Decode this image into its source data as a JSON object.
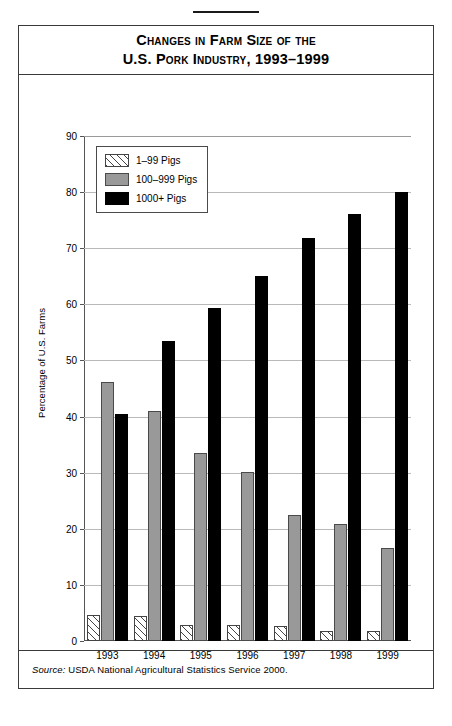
{
  "figure": {
    "title_line1": "Changes in Farm Size of the",
    "title_line2": "U.S. Pork Industry, 1993–1999",
    "source_label": "Source:",
    "source_text": " USDA National Agricultural Statistics Service 2000."
  },
  "colors": {
    "series_1_99": "#ffffff",
    "series_100_999": "#999999",
    "series_1000plus": "#000000",
    "gridline": "#b9b9b9",
    "axis": "#555555",
    "frame": "#3a3a3a"
  },
  "chart_data": {
    "type": "bar",
    "title": "Changes in Farm Size of the U.S. Pork Industry, 1993–1999",
    "xlabel": "",
    "ylabel": "Percentage of U.S. Farms",
    "categories": [
      "1993",
      "1994",
      "1995",
      "1996",
      "1997",
      "1998",
      "1999"
    ],
    "yticks": [
      0,
      10,
      20,
      30,
      40,
      50,
      60,
      70,
      80,
      90
    ],
    "ylim": [
      0,
      90
    ],
    "grid": true,
    "legend_position": "top-left inside",
    "series": [
      {
        "name": "1–99 Pigs",
        "values": [
          4.7,
          4.5,
          2.8,
          2.8,
          2.7,
          1.7,
          1.8
        ]
      },
      {
        "name": "100–999 Pigs",
        "values": [
          46.2,
          41.0,
          33.5,
          30.1,
          22.4,
          20.9,
          16.6
        ]
      },
      {
        "name": "1000+ Pigs",
        "values": [
          40.4,
          53.5,
          59.4,
          65.1,
          71.9,
          76.1,
          80.1
        ]
      }
    ]
  }
}
